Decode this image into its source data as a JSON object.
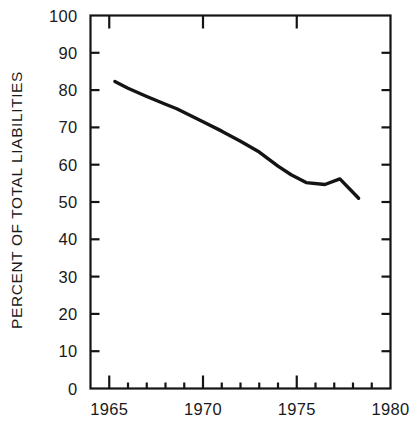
{
  "chart_data": {
    "type": "line",
    "title": "",
    "xlabel": "",
    "ylabel": "PERCENT OF TOTAL LIABILITIES",
    "xlim": [
      1964,
      1980
    ],
    "ylim": [
      0,
      100
    ],
    "grid": false,
    "legend": null,
    "x_ticks_major": [
      "1965",
      "1970",
      "1975",
      "1980"
    ],
    "x_tick_values_major": [
      1965,
      1970,
      1975,
      1980
    ],
    "x_minor_tick_step": 1,
    "y_ticks": [
      "0",
      "10",
      "20",
      "30",
      "40",
      "50",
      "60",
      "70",
      "80",
      "90",
      "100"
    ],
    "y_tick_values": [
      0,
      10,
      20,
      30,
      40,
      50,
      60,
      70,
      80,
      90,
      100
    ],
    "series": [
      {
        "name": "Percent of total liabilities",
        "color": "#141414",
        "x": [
          1965.3,
          1966,
          1967,
          1968,
          1968.6,
          1970,
          1971,
          1972,
          1973,
          1974,
          1974.7,
          1975.5,
          1976.5,
          1977.3,
          1978.3
        ],
        "values": [
          82.3,
          80.5,
          78.3,
          76.2,
          75.0,
          71.5,
          69.0,
          66.3,
          63.4,
          59.6,
          57.3,
          55.2,
          54.7,
          56.2,
          51.0
        ]
      }
    ],
    "axis_style": {
      "frame": true,
      "tick_direction": "in",
      "line_color": "#141414",
      "line_width": 2.2,
      "data_line_width": 3.4
    }
  }
}
